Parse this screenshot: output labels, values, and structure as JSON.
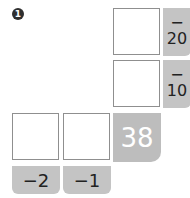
{
  "problem_number": "1",
  "column_boxes": [
    {
      "value": "",
      "operator": "−",
      "operand": "20"
    },
    {
      "value": "",
      "operator": "−",
      "operand": "10"
    }
  ],
  "row_boxes": [
    {
      "value": "",
      "operator": "−",
      "operand": "2"
    },
    {
      "value": "",
      "operator": "−",
      "operand": "1"
    }
  ],
  "result": "38",
  "colors": {
    "tab_gray": "#c4c4c4",
    "result_gray": "#bdbdbd",
    "border": "#8f8f8f"
  }
}
